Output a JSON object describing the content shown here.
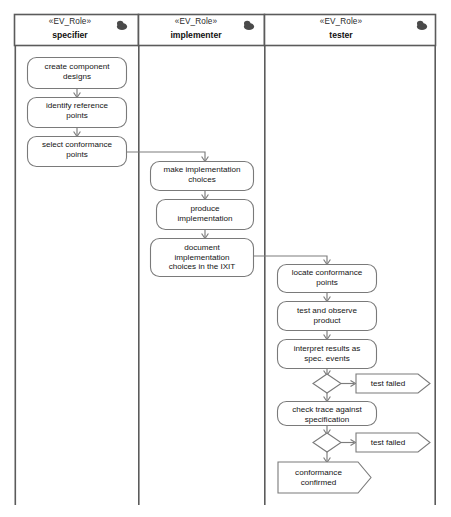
{
  "diagram": {
    "type": "uml-activity-swimlane",
    "stereotype": "«EV_Role»",
    "colors": {
      "lane_border": "#5b5b5b",
      "node_border": "#7a7a7a",
      "edge": "#7c7c7c",
      "background": "#ffffff",
      "text": "#141414",
      "role_icon": "#4a4a4a"
    }
  },
  "lanes": [
    {
      "id": "specifier",
      "stereotype": "«EV_Role»",
      "title": "specifier",
      "icon": "role-actor-icon"
    },
    {
      "id": "implementer",
      "stereotype": "«EV_Role»",
      "title": "implementer",
      "icon": "role-actor-icon"
    },
    {
      "id": "tester",
      "stereotype": "«EV_Role»",
      "title": "tester",
      "icon": "role-actor-icon"
    }
  ],
  "nodes": {
    "create_component_designs": {
      "label": "create component\ndesigns",
      "lane": "specifier",
      "kind": "activity"
    },
    "identify_reference_points": {
      "label": "identify reference\npoints",
      "lane": "specifier",
      "kind": "activity"
    },
    "select_conformance_points": {
      "label": "select conformance\npoints",
      "lane": "specifier",
      "kind": "activity"
    },
    "make_implementation_choices": {
      "label": "make implementation\nchoices",
      "lane": "implementer",
      "kind": "activity"
    },
    "produce_implementation": {
      "label": "produce\nimplementation",
      "lane": "implementer",
      "kind": "activity"
    },
    "document_implementation": {
      "label": "document\nimplementation\nchoices in the IXIT",
      "lane": "implementer",
      "kind": "activity"
    },
    "locate_conformance_points": {
      "label": "locate conformance\npoints",
      "lane": "tester",
      "kind": "activity"
    },
    "test_and_observe_product": {
      "label": "test and observe\nproduct",
      "lane": "tester",
      "kind": "activity"
    },
    "interpret_results": {
      "label": "interpret results as\nspec. events",
      "lane": "tester",
      "kind": "activity"
    },
    "decision_1": {
      "label": "",
      "lane": "tester",
      "kind": "decision"
    },
    "test_failed_1": {
      "label": "test failed",
      "lane": "tester",
      "kind": "signal"
    },
    "check_trace": {
      "label": "check trace against\nspecification",
      "lane": "tester",
      "kind": "activity"
    },
    "decision_2": {
      "label": "",
      "lane": "tester",
      "kind": "decision"
    },
    "test_failed_2": {
      "label": "test failed",
      "lane": "tester",
      "kind": "signal"
    },
    "conformance_confirmed": {
      "label": "conformance\nconfirmed",
      "lane": "tester",
      "kind": "signal"
    }
  },
  "edges": [
    {
      "from": "create_component_designs",
      "to": "identify_reference_points",
      "label": ""
    },
    {
      "from": "identify_reference_points",
      "to": "select_conformance_points",
      "label": ""
    },
    {
      "from": "select_conformance_points",
      "to": "make_implementation_choices",
      "label": ""
    },
    {
      "from": "make_implementation_choices",
      "to": "produce_implementation",
      "label": ""
    },
    {
      "from": "produce_implementation",
      "to": "document_implementation",
      "label": ""
    },
    {
      "from": "document_implementation",
      "to": "locate_conformance_points",
      "label": ""
    },
    {
      "from": "locate_conformance_points",
      "to": "test_and_observe_product",
      "label": ""
    },
    {
      "from": "test_and_observe_product",
      "to": "interpret_results",
      "label": ""
    },
    {
      "from": "interpret_results",
      "to": "decision_1",
      "label": ""
    },
    {
      "from": "decision_1",
      "to": "test_failed_1",
      "label": ""
    },
    {
      "from": "decision_1",
      "to": "check_trace",
      "label": ""
    },
    {
      "from": "check_trace",
      "to": "decision_2",
      "label": ""
    },
    {
      "from": "decision_2",
      "to": "test_failed_2",
      "label": ""
    },
    {
      "from": "decision_2",
      "to": "conformance_confirmed",
      "label": ""
    }
  ]
}
